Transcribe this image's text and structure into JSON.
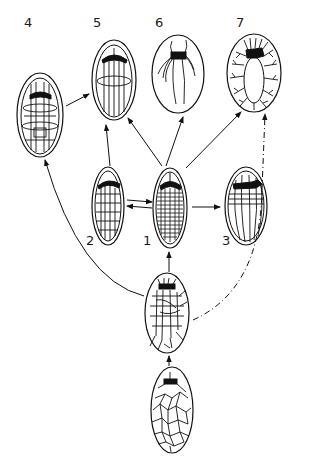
{
  "figure": {
    "stages": [
      {
        "id": "1",
        "label": "1",
        "pattern": "dense transverse and longitudinal lattice"
      },
      {
        "id": "2",
        "label": "2",
        "pattern": "grid lattice"
      },
      {
        "id": "3",
        "label": "3",
        "pattern": "longitudinal lines with few transverse bands"
      },
      {
        "id": "4",
        "label": "4",
        "pattern": "grid with transverse rings"
      },
      {
        "id": "5",
        "label": "5",
        "pattern": "longitudinal lines with one equatorial ring"
      },
      {
        "id": "6",
        "label": "6",
        "pattern": "few long curved fibres from apical body"
      },
      {
        "id": "7",
        "label": "7",
        "pattern": "peripheral branched fibres around clear center"
      },
      {
        "id": "A",
        "label": "",
        "pattern": "irregular network with apical body"
      },
      {
        "id": "B",
        "label": "",
        "pattern": "irregular polygonal network"
      }
    ],
    "transitions": [
      {
        "from": "B",
        "to": "A",
        "style": "solid"
      },
      {
        "from": "A",
        "to": "1",
        "style": "solid"
      },
      {
        "from": "A",
        "to": "4",
        "style": "solid"
      },
      {
        "from": "A",
        "to": "7",
        "style": "dashed"
      },
      {
        "from": "1",
        "to": "2",
        "style": "solid"
      },
      {
        "from": "2",
        "to": "1",
        "style": "solid"
      },
      {
        "from": "1",
        "to": "3",
        "style": "solid"
      },
      {
        "from": "1",
        "to": "5",
        "style": "solid"
      },
      {
        "from": "1",
        "to": "6",
        "style": "solid"
      },
      {
        "from": "1",
        "to": "7",
        "style": "solid"
      },
      {
        "from": "2",
        "to": "5",
        "style": "solid"
      },
      {
        "from": "4",
        "to": "5",
        "style": "solid"
      }
    ]
  },
  "colors": {
    "ink": "#111111",
    "background": "#ffffff"
  }
}
